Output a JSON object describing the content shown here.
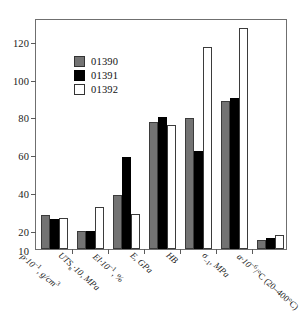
{
  "chart_data": {
    "type": "bar",
    "title": "",
    "subtitle": "",
    "xlabel": "",
    "ylabel": "",
    "ylim": [
      10,
      132
    ],
    "yticks": [
      20,
      40,
      60,
      80,
      100,
      120
    ],
    "ytick_labels": [
      "20",
      "40",
      "60",
      "80",
      "100",
      "120"
    ],
    "grid": false,
    "legend_position": "upper-left-inside",
    "categories": [
      "ρ·10⁻¹, g/cm³",
      "UTSв·10, MPa",
      "El·10⁻¹, %",
      "E, GPa",
      "HB",
      "σ₋₁, MPa",
      "α·10⁻⁶/°C (20–400°C)"
    ],
    "series": [
      {
        "name": "01390",
        "color": "#737373",
        "values": [
          28,
          19.5,
          38.5,
          77,
          79,
          88,
          15
        ]
      },
      {
        "name": "01391",
        "color": "#000000",
        "values": [
          26,
          19.5,
          58.5,
          79.5,
          62,
          89.5,
          16
        ]
      },
      {
        "name": "01392",
        "color": "#ffffff",
        "values": [
          26.5,
          32,
          28.5,
          75.5,
          116.5,
          126.5,
          17.5
        ]
      }
    ]
  },
  "legend": {
    "items": [
      {
        "label": "01390",
        "swatch": "gray-filled-square"
      },
      {
        "label": "01391",
        "swatch": "black-filled-square"
      },
      {
        "label": "01392",
        "swatch": "white-open-square"
      }
    ]
  },
  "axis": {
    "y_tick_labels": [
      "120",
      "100",
      "80",
      "60",
      "40",
      "20",
      "10"
    ],
    "baseline_label": "10"
  },
  "x_axis_labels": [
    {
      "id": "density",
      "parts": [
        {
          "t": "ρ·10",
          "k": "it"
        },
        {
          "t": "–1",
          "k": "sup"
        },
        {
          "t": ", g/cm",
          "k": "it"
        },
        {
          "t": "3",
          "k": "sup"
        }
      ],
      "plain": "ρ·10⁻¹, g/cm³"
    },
    {
      "id": "uts",
      "parts": [
        {
          "t": "UTS",
          "k": "it"
        },
        {
          "t": "в",
          "k": "sub"
        },
        {
          "t": "·10, MPa",
          "k": "it"
        }
      ],
      "plain": "UTSв·10, MPa"
    },
    {
      "id": "elongation",
      "parts": [
        {
          "t": "El·10",
          "k": "it"
        },
        {
          "t": "–1",
          "k": "sup"
        },
        {
          "t": ", %",
          "k": "it"
        }
      ],
      "plain": "El·10⁻¹, %"
    },
    {
      "id": "youngs-modulus",
      "parts": [
        {
          "t": "E, GPa",
          "k": "it"
        }
      ],
      "plain": "E, GPa"
    },
    {
      "id": "brinell-hardness",
      "parts": [
        {
          "t": "HB",
          "k": "it"
        }
      ],
      "plain": "HB"
    },
    {
      "id": "fatigue-limit",
      "parts": [
        {
          "t": "σ",
          "k": "it"
        },
        {
          "t": "–1",
          "k": "sub"
        },
        {
          "t": ", MPa",
          "k": "it"
        }
      ],
      "plain": "σ₋₁, MPa"
    },
    {
      "id": "thermal-expansion",
      "parts": [
        {
          "t": "α·10",
          "k": "it"
        },
        {
          "t": "–6",
          "k": "sup"
        },
        {
          "t": "/°C (20–400°C)",
          "k": "rm"
        }
      ],
      "plain": "α·10⁻⁶/°C (20–400°C)"
    }
  ]
}
